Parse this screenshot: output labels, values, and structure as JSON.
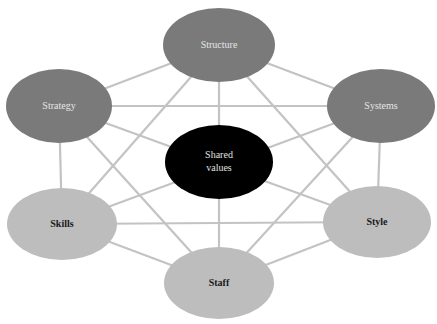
{
  "diagram": {
    "colors": {
      "edge": "#c3c3c3",
      "dark_node": "#7a7a7a",
      "light_node": "#bdbdbd",
      "center_node": "#000000"
    },
    "nodes": {
      "structure": {
        "label": "Structure"
      },
      "strategy": {
        "label": "Strategy"
      },
      "systems": {
        "label": "Systems"
      },
      "shared_values": {
        "line1": "Shared",
        "line2": "values"
      },
      "skills": {
        "label": "Skills"
      },
      "style": {
        "label": "Style"
      },
      "staff": {
        "label": "Staff"
      }
    }
  }
}
